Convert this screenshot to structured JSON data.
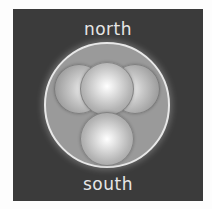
{
  "diagram": {
    "labels": {
      "top": "north",
      "bottom": "south"
    },
    "outer_circle": {
      "description": "container circle",
      "fill": "#9a9a9a",
      "stroke": "#e8e8e8"
    },
    "spheres": [
      {
        "position": "top-center",
        "layer": "front"
      },
      {
        "position": "left",
        "layer": "back"
      },
      {
        "position": "right",
        "layer": "back"
      },
      {
        "position": "bottom-center",
        "layer": "front"
      }
    ],
    "background_color": "#3b3b3b",
    "text_color": "#e6e6e6"
  }
}
